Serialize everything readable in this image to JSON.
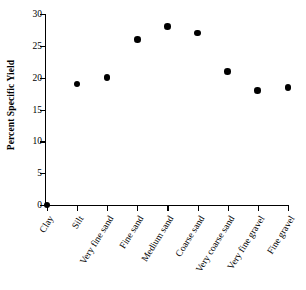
{
  "chart_data": {
    "type": "scatter",
    "title": "",
    "xlabel": "",
    "ylabel": "Percent Specific Yield",
    "categories": [
      "Clay",
      "Silt",
      "Very fine sand",
      "Fine sand",
      "Medium sand",
      "Coarse sand",
      "Very coarse sand",
      "Very fine gravel",
      "Fine gravel"
    ],
    "values": [
      0,
      19,
      20,
      26,
      28,
      27,
      21,
      18,
      18.5
    ],
    "ylim": [
      0,
      30
    ],
    "yticks": [
      0,
      5,
      10,
      15,
      20,
      25,
      30
    ],
    "ytick_labels": [
      "0",
      "5",
      "10",
      "15",
      "20",
      "25",
      "30"
    ],
    "grid": false,
    "legend": false,
    "marker": "filled-circle",
    "marker_color": "#000000",
    "axis_color": "#000000"
  }
}
